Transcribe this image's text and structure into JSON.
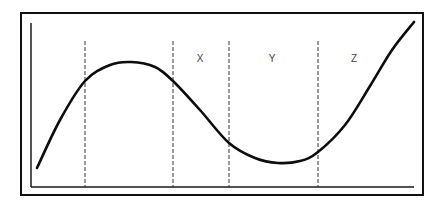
{
  "diagram": {
    "type": "curve-with-region-dividers",
    "frame": {
      "x": 21,
      "y": 13,
      "width": 402,
      "height": 182
    },
    "axes": {
      "origin": {
        "x": 31,
        "y": 187
      },
      "y_axis_top": 23,
      "x_axis_right": 414,
      "x_label": "",
      "y_label": ""
    },
    "dividers_x": [
      85,
      173,
      229,
      318
    ],
    "regions": [
      {
        "label": "X",
        "x": 200,
        "y": 62
      },
      {
        "label": "Y",
        "x": 272,
        "y": 62
      },
      {
        "label": "Z",
        "x": 354,
        "y": 62
      }
    ],
    "curve_points": [
      [
        37,
        168
      ],
      [
        60,
        120
      ],
      [
        85,
        81
      ],
      [
        110,
        65
      ],
      [
        131,
        62
      ],
      [
        155,
        67
      ],
      [
        173,
        81
      ],
      [
        200,
        110
      ],
      [
        229,
        143
      ],
      [
        255,
        158
      ],
      [
        278,
        163
      ],
      [
        300,
        161
      ],
      [
        318,
        152
      ],
      [
        345,
        125
      ],
      [
        370,
        86
      ],
      [
        392,
        50
      ],
      [
        414,
        22
      ]
    ],
    "colors": {
      "line": "#111111",
      "label": "#444444",
      "background": "#ffffff"
    }
  }
}
